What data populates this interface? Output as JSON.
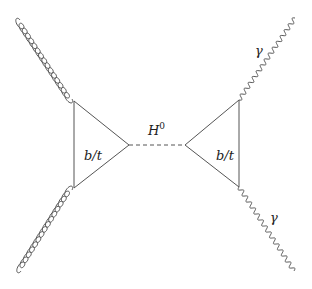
{
  "diagram": {
    "type": "feynman-diagram",
    "process": "gg -> H0 -> gamma gamma",
    "loops": [
      {
        "id": "left-loop",
        "label": "b/t",
        "vertices": [
          [
            74,
            101
          ],
          [
            74,
            188
          ],
          [
            129,
            145
          ]
        ]
      },
      {
        "id": "right-loop",
        "label": "b/t",
        "vertices": [
          [
            239,
            100
          ],
          [
            239,
            187
          ],
          [
            185,
            145
          ]
        ]
      }
    ],
    "propagator": {
      "label": "H",
      "superscript": "0",
      "style": "dashed",
      "from": [
        129,
        145
      ],
      "to": [
        185,
        145
      ]
    },
    "external_lines": [
      {
        "id": "gluon-top-left",
        "type": "gluon",
        "from": [
          20,
          20
        ],
        "to": [
          72,
          99
        ]
      },
      {
        "id": "gluon-bottom-left",
        "type": "gluon",
        "from": [
          72,
          190
        ],
        "to": [
          21,
          271
        ]
      },
      {
        "id": "photon-top-right",
        "type": "photon",
        "label": "γ",
        "from": [
          239,
          100
        ],
        "to": [
          295,
          18
        ]
      },
      {
        "id": "photon-bottom-right",
        "type": "photon",
        "label": "γ",
        "from": [
          239,
          187
        ],
        "to": [
          294,
          271
        ]
      }
    ],
    "colors": {
      "line": "#555555",
      "text": "#222222",
      "background": "#ffffff"
    }
  },
  "labels": {
    "left_loop": "b/t",
    "right_loop": "b/t",
    "higgs": "H",
    "higgs_sup": "0",
    "photon_top": "γ",
    "photon_bottom": "γ"
  }
}
